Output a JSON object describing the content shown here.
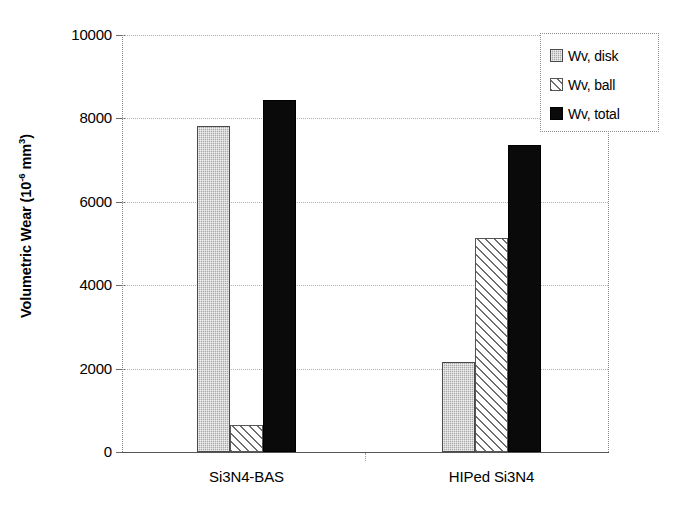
{
  "chart_data": {
    "type": "bar",
    "title": "",
    "xlabel": "",
    "ylabel": "Volumetric Wear (10-6 mm3)",
    "ylabel_parts": {
      "main": "Volumetric Wear (10",
      "exponent": "-6",
      "unit": " mm",
      "unit_exponent": "3",
      "close": ")"
    },
    "categories": [
      "Si3N4-BAS",
      "HIPed Si3N4"
    ],
    "series": [
      {
        "name": "Wv, disk",
        "pattern": "gray-stipple",
        "color": "#a8a8a8",
        "values": [
          7820,
          2160
        ]
      },
      {
        "name": "Wv, ball",
        "pattern": "diagonal-hatch",
        "color": "#ffffff",
        "values": [
          650,
          5130
        ]
      },
      {
        "name": "Wv, total",
        "pattern": "solid-black",
        "color": "#0a0a0a",
        "values": [
          8440,
          7360
        ]
      }
    ],
    "ylim": [
      0,
      10000
    ],
    "yticks": [
      0,
      2000,
      4000,
      6000,
      8000,
      10000
    ],
    "ytick_labels": [
      "0",
      "2000",
      "4000",
      "6000",
      "8000",
      "10000"
    ],
    "grid": true,
    "grid_style": "dotted",
    "legend_position": "top-right"
  },
  "legend": {
    "entries": [
      {
        "label": "Wv, disk"
      },
      {
        "label": "Wv, ball"
      },
      {
        "label": "Wv, total"
      }
    ]
  },
  "axis": {
    "y_title": "Volumetric Wear (10",
    "y_title_exp": "-6",
    "y_title_unit": " mm",
    "y_title_unit_exp": "3",
    "y_title_close": ")"
  }
}
